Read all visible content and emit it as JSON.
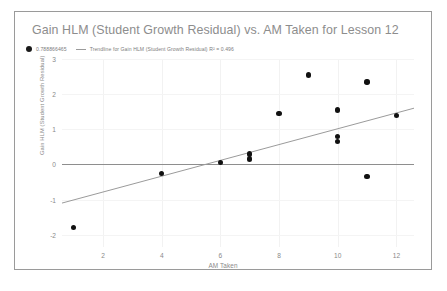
{
  "chart_data": {
    "type": "scatter",
    "title": "Gain HLM (Student Growth Residual) vs. AM Taken for Lesson 12",
    "xlabel": "AM Taken",
    "ylabel": "Gain HLM (Student Growth Residual)",
    "xlim": [
      0.6,
      12.6
    ],
    "ylim": [
      -2.35,
      3.0
    ],
    "xticks": [
      "2",
      "4",
      "6",
      "8",
      "10",
      "12"
    ],
    "xtick_values": [
      2,
      4,
      6,
      8,
      10,
      12
    ],
    "yticks": [
      "3",
      "2",
      "1",
      "0",
      "-1",
      "-2"
    ],
    "ytick_values": [
      3,
      2,
      1,
      0,
      -1,
      -2
    ],
    "grid": true,
    "legend_position": "top-left",
    "series": [
      {
        "name": "0.788866465",
        "marker": "circle",
        "color": "#111111",
        "points": [
          {
            "x": 1,
            "y": -1.8
          },
          {
            "x": 4,
            "y": -0.25
          },
          {
            "x": 6,
            "y": 0.05
          },
          {
            "x": 7,
            "y": 0.3
          },
          {
            "x": 7,
            "y": 0.15
          },
          {
            "x": 8,
            "y": 1.45
          },
          {
            "x": 9,
            "y": 2.55
          },
          {
            "x": 10,
            "y": 1.55
          },
          {
            "x": 10,
            "y": 0.8
          },
          {
            "x": 10,
            "y": 0.65
          },
          {
            "x": 11,
            "y": 2.35
          },
          {
            "x": 11,
            "y": -0.35
          },
          {
            "x": 12,
            "y": 1.4
          }
        ]
      },
      {
        "name": "Trendline for Gain HLM (Student Growth Residual) R² = 0.496",
        "type": "line",
        "color": "#9b9b9b",
        "r_squared": 0.496,
        "endpoints": [
          {
            "x": 0.6,
            "y": -1.1
          },
          {
            "x": 12.6,
            "y": 1.6
          }
        ]
      }
    ]
  },
  "legend": {
    "entries": [
      {
        "label": "0.788866465",
        "marker": "dot"
      },
      {
        "label": "Trendline for Gain HLM (Student Growth Residual) R² = 0.496",
        "marker": "line"
      }
    ]
  },
  "colors": {
    "point": "#111111",
    "trendline": "#9b9b9b",
    "zeroline": "#8e8e8e",
    "grid": "#f2f2f2",
    "text": "#8a8a8a",
    "title": "#8d8d8d",
    "border": "#9a9a9a"
  }
}
